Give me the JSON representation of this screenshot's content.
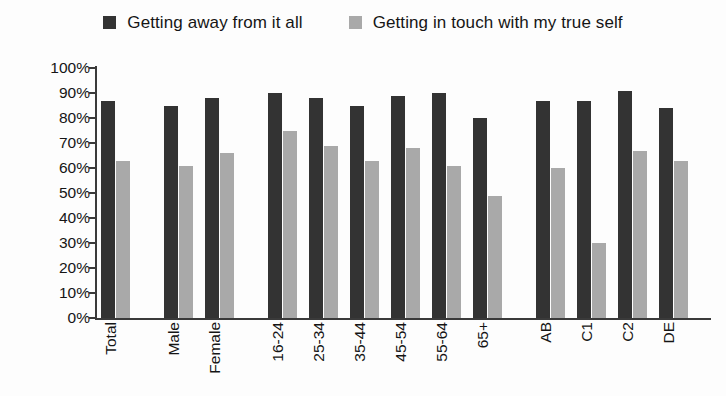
{
  "chart_data": {
    "type": "bar",
    "title": "",
    "subtitle": "",
    "xlabel": "",
    "ylabel": "",
    "ylim": [
      0,
      100
    ],
    "grid": false,
    "legend_position": "top-center",
    "y_tick_labels": [
      "100%",
      "90%",
      "80%",
      "70%",
      "60%",
      "50%",
      "40%",
      "30%",
      "20%",
      "10%",
      "0%"
    ],
    "y_tick_values": [
      100,
      90,
      80,
      70,
      60,
      50,
      40,
      30,
      20,
      10,
      0
    ],
    "categories": [
      "Total",
      "Male",
      "Female",
      "16-24",
      "25-34",
      "35-44",
      "45-54",
      "55-64",
      "65+",
      "AB",
      "C1",
      "C2",
      "DE"
    ],
    "category_groups": [
      {
        "name": "total",
        "categories": [
          "Total"
        ]
      },
      {
        "name": "gender",
        "categories": [
          "Male",
          "Female"
        ]
      },
      {
        "name": "age",
        "categories": [
          "16-24",
          "25-34",
          "35-44",
          "45-54",
          "55-64",
          "65+"
        ]
      },
      {
        "name": "social-grade",
        "categories": [
          "AB",
          "C1",
          "C2",
          "DE"
        ]
      }
    ],
    "series": [
      {
        "name": "Getting away from it all",
        "color": "#333333",
        "values": [
          87,
          85,
          88,
          90,
          88,
          85,
          89,
          90,
          80,
          87,
          87,
          91,
          84
        ]
      },
      {
        "name": "Getting in touch with my true self",
        "color": "#a9a9a9",
        "values": [
          63,
          61,
          66,
          75,
          69,
          63,
          68,
          61,
          49,
          60,
          30,
          67,
          63
        ]
      }
    ]
  },
  "legend": {
    "entries": [
      {
        "label": "Getting away from it all",
        "swatch_color": "#333333",
        "swatch_name": "legend-swatch-dark"
      },
      {
        "label": "Getting in touch with my true self",
        "swatch_color": "#a9a9a9",
        "swatch_name": "legend-swatch-light"
      }
    ]
  },
  "axes": {
    "y_axis_name": "percentage-axis",
    "x_axis_name": "category-axis"
  }
}
